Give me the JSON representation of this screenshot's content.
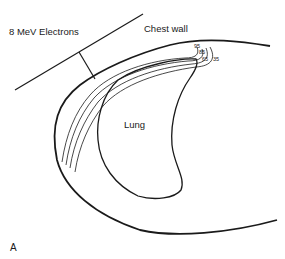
{
  "figure": {
    "panel_label": "A",
    "beam_label": "8 MeV Electrons",
    "chest_wall_label": "Chest wall",
    "lung_label": "Lung",
    "isodose_labels": [
      "95",
      "85",
      "65",
      "35"
    ],
    "line_color": "#1a1a1a",
    "background": "#ffffff"
  }
}
